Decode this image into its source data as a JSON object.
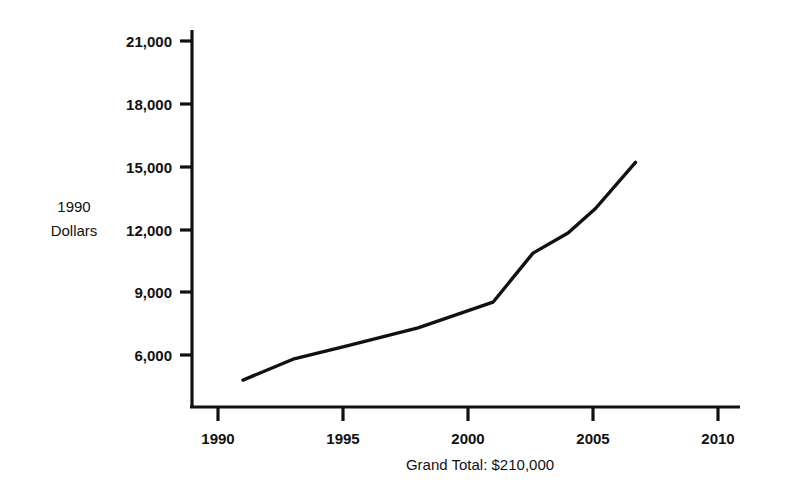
{
  "chart_data": {
    "type": "line",
    "title": "",
    "subtitle": "",
    "xlabel": "",
    "ylabel": "1990 Dollars",
    "ylabel_lines": [
      "1990",
      "Dollars"
    ],
    "caption": "Grand Total: $210,000",
    "grid": false,
    "legend": "none",
    "xlim": [
      1988.8,
      2011.6
    ],
    "ylim": [
      4300,
      22000
    ],
    "x_ticks": [
      1990,
      1995,
      2000,
      2005,
      2010
    ],
    "x_tick_labels": [
      "1990",
      "1995",
      "2000",
      "2005",
      "2010"
    ],
    "y_ticks": [
      6000,
      9000,
      12000,
      15000,
      18000,
      21000
    ],
    "y_tick_labels": [
      "6,000",
      "9,000",
      "12,000",
      "15,000",
      "18,000",
      "21,000"
    ],
    "series": [
      {
        "name": "1990 Dollars",
        "color": "#111111",
        "x": [
          1991.0,
          1993.0,
          1995.2,
          1998.0,
          2001.0,
          2002.6,
          2004.0,
          2005.1,
          2006.7
        ],
        "values": [
          4800,
          5800,
          6450,
          7300,
          8520,
          10870,
          11830,
          13000,
          15200
        ]
      }
    ]
  },
  "axes": {
    "y_axis_name": "vertical-value-axis",
    "x_axis_name": "horizontal-year-axis"
  }
}
